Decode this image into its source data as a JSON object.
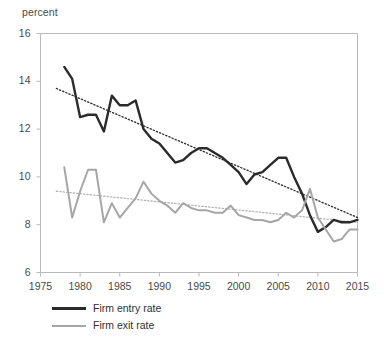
{
  "axis_unit_label": "percent",
  "legend": {
    "entry_label": "Firm entry rate",
    "exit_label": "Firm exit rate"
  },
  "colors": {
    "entry": "#2b2b2b",
    "exit": "#a6a6a6",
    "entry_trend": "#2b2b2b",
    "exit_trend": "#b4b4b4",
    "axis": "#b9b9b9",
    "text": "#4a4a4a"
  },
  "chart_data": {
    "type": "line",
    "title": "",
    "xlabel": "",
    "ylabel": "percent",
    "xlim": [
      1975,
      2015
    ],
    "ylim": [
      6,
      16
    ],
    "xticks": [
      1975,
      1980,
      1985,
      1990,
      1995,
      2000,
      2005,
      2010,
      2015
    ],
    "yticks": [
      6,
      8,
      10,
      12,
      14,
      16
    ],
    "grid": false,
    "legend_position": "below-left",
    "x": [
      1978,
      1979,
      1980,
      1981,
      1982,
      1983,
      1984,
      1985,
      1986,
      1987,
      1988,
      1989,
      1990,
      1991,
      1992,
      1993,
      1994,
      1995,
      1996,
      1997,
      1998,
      1999,
      2000,
      2001,
      2002,
      2003,
      2004,
      2005,
      2006,
      2007,
      2008,
      2009,
      2010,
      2011,
      2012,
      2013,
      2014,
      2015
    ],
    "series": [
      {
        "name": "Firm entry rate",
        "color": "#2b2b2b",
        "values": [
          14.6,
          14.1,
          12.5,
          12.6,
          12.6,
          11.9,
          13.4,
          13.0,
          13.0,
          13.2,
          12.0,
          11.6,
          11.4,
          11.0,
          10.6,
          10.7,
          11.0,
          11.2,
          11.2,
          11.0,
          10.8,
          10.5,
          10.2,
          9.7,
          10.1,
          10.2,
          10.5,
          10.8,
          10.8,
          10.0,
          9.3,
          8.4,
          7.7,
          7.9,
          8.2,
          8.1,
          8.1,
          8.2
        ]
      },
      {
        "name": "Firm exit rate",
        "color": "#a6a6a6",
        "values": [
          10.4,
          8.3,
          9.4,
          10.3,
          10.3,
          8.1,
          8.9,
          8.3,
          8.7,
          9.1,
          9.8,
          9.3,
          9.0,
          8.8,
          8.5,
          8.9,
          8.7,
          8.6,
          8.6,
          8.5,
          8.5,
          8.8,
          8.4,
          8.3,
          8.2,
          8.2,
          8.1,
          8.2,
          8.5,
          8.3,
          8.6,
          9.5,
          8.3,
          7.8,
          7.3,
          7.4,
          7.8,
          7.8
        ]
      }
    ],
    "trendlines": [
      {
        "name": "Firm entry rate trend",
        "style": "dotted",
        "color": "#2b2b2b",
        "x": [
          1977,
          2015
        ],
        "y": [
          13.7,
          8.3
        ]
      },
      {
        "name": "Firm exit rate trend",
        "style": "dotted",
        "color": "#b4b4b4",
        "x": [
          1977,
          2015
        ],
        "y": [
          9.4,
          8.1
        ]
      }
    ]
  }
}
